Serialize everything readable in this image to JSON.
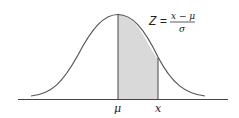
{
  "diagram": {
    "formula": {
      "lhs": "Z =",
      "numerator": "x − μ",
      "denominator": "σ"
    },
    "axis_labels": {
      "mean": "μ",
      "value": "x"
    },
    "colors": {
      "curve": "#555555",
      "shade": "#d9d9d9",
      "axis": "#444444"
    }
  }
}
